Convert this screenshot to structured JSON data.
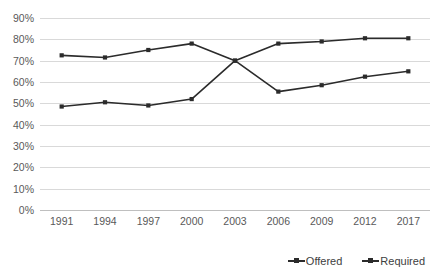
{
  "chart_data": {
    "type": "line",
    "title": "",
    "subtitle": "",
    "xlabel": "",
    "ylabel": "",
    "grid": true,
    "legend_position": "bottom-right",
    "categories": [
      "1991",
      "1994",
      "1997",
      "2000",
      "2003",
      "2006",
      "2009",
      "2012",
      "2017"
    ],
    "ylim": [
      0,
      90
    ],
    "ytick_labels": [
      "90%",
      "80%",
      "70%",
      "60%",
      "50%",
      "40%",
      "30%",
      "20%",
      "10%",
      "0%"
    ],
    "ytick_values": [
      90,
      80,
      70,
      60,
      50,
      40,
      30,
      20,
      10,
      0
    ],
    "ytick_format": "percent",
    "series": [
      {
        "name": "Offered",
        "color": "#2b2b2b",
        "marker": "square",
        "values": [
          72.5,
          71.5,
          75.0,
          78.0,
          70.0,
          78.0,
          79.0,
          80.5,
          80.5
        ]
      },
      {
        "name": "Required",
        "color": "#2b2b2b",
        "marker": "square",
        "values": [
          48.5,
          50.5,
          49.0,
          52.0,
          70.0,
          55.5,
          58.5,
          62.5,
          65.0
        ]
      }
    ],
    "legend": [
      {
        "label": "Offered"
      },
      {
        "label": "Required"
      }
    ],
    "annotations": []
  }
}
